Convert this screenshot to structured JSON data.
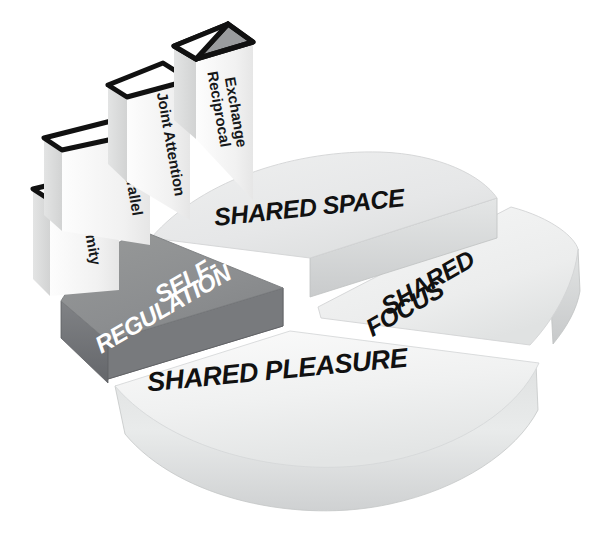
{
  "diagram": {
    "background_color": "#ffffff",
    "type": "3d-exploded-pie-with-steps"
  },
  "pie": {
    "segments": [
      {
        "id": "shared-space",
        "label": "SHARED SPACE",
        "label_lines": [
          "SHARED SPACE"
        ],
        "top_color": "#eceded",
        "side_color": "#d0d2d3",
        "text_color": "#111111"
      },
      {
        "id": "shared-focus",
        "label": "SHARED FOCUS",
        "label_lines": [
          "SHARED",
          "FOCUS"
        ],
        "top_color": "#f2f3f3",
        "side_color": "#d8dadb",
        "text_color": "#111111"
      },
      {
        "id": "shared-pleasure",
        "label": "SHARED PLEASURE",
        "label_lines": [
          "SHARED PLEASURE"
        ],
        "top_color": "#f1f2f2",
        "side_color": "#d7d9da",
        "text_color": "#111111"
      },
      {
        "id": "self-regulation",
        "label": "SELF-REGULATION",
        "label_lines": [
          "SELF-",
          "REGULATION"
        ],
        "top_color": "#8e9092",
        "side_color": "#6f7173",
        "text_color": "#ffffff"
      }
    ]
  },
  "steps": {
    "items": [
      {
        "id": "proximity",
        "label": "Proximity",
        "label_lines": [
          "Proximity"
        ],
        "order": 1,
        "top_style": "outline",
        "face_color": "#f2f2f2",
        "side_color": "#dcdddd"
      },
      {
        "id": "parallel",
        "label": "Parallel",
        "label_lines": [
          "Parallel"
        ],
        "order": 2,
        "top_style": "outline",
        "face_color": "#f2f2f2",
        "side_color": "#dcdddd"
      },
      {
        "id": "joint-attention",
        "label": "Joint Attention",
        "label_lines": [
          "Joint Attention"
        ],
        "order": 3,
        "top_style": "outline",
        "face_color": "#f2f2f2",
        "side_color": "#dcdddd"
      },
      {
        "id": "reciprocal-exchange",
        "label": "Reciprocal Exchange",
        "label_lines": [
          "Reciprocal",
          "Exchange"
        ],
        "order": 4,
        "top_style": "split-shaded",
        "shade_color": "#9a9c9e",
        "face_color": "#f2f2f2",
        "side_color": "#dcdddd"
      }
    ]
  },
  "palette": {
    "outline": "#111111",
    "highlight": "#ffffff",
    "gray_mid": "#8e9092",
    "gray_dark": "#6f7173",
    "gray_light": "#e9eaea"
  }
}
